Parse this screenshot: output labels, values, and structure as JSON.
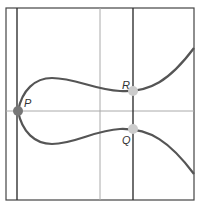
{
  "diagram": {
    "points": [
      {
        "label": "P",
        "x": 18,
        "y": 111,
        "color": "#777777"
      },
      {
        "label": "R",
        "x": 133,
        "y": 91,
        "color": "#cccccc"
      },
      {
        "label": "Q",
        "x": 133,
        "y": 129,
        "color": "#cccccc"
      }
    ],
    "colors": {
      "curve": "#555555",
      "frame": "#444444",
      "axis": "#aaaaaa",
      "line": "#333333"
    }
  }
}
